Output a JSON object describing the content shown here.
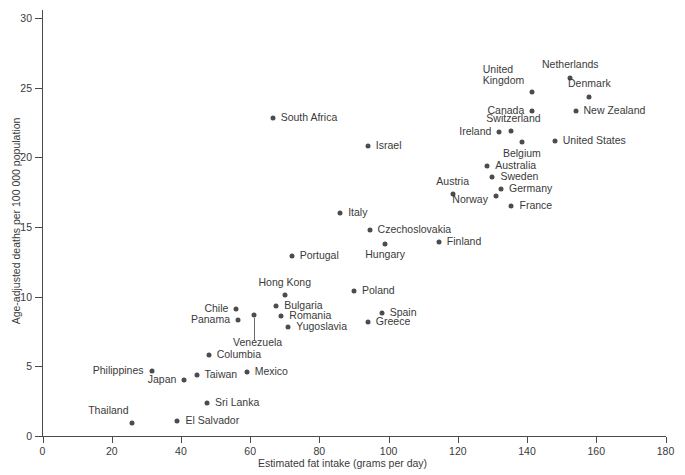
{
  "chart_data": {
    "type": "scatter",
    "title": "",
    "xlabel": "Estimated fat intake (grams per day)",
    "ylabel": "Age-adjusted deaths per 100 000 population",
    "xlim": [
      0,
      180
    ],
    "ylim": [
      0,
      30
    ],
    "xticks": [
      0,
      20,
      40,
      60,
      80,
      100,
      120,
      140,
      160,
      180
    ],
    "yticks": [
      0,
      5,
      10,
      15,
      20,
      25,
      30
    ],
    "grid": false,
    "legend": "none",
    "marker_color": "#4c4c4c",
    "axis_color": "#4a4a4a",
    "points": [
      {
        "label": "Netherlands",
        "x": 152.5,
        "y": 25.7,
        "lx": 0,
        "ly": -13,
        "anchor": "center"
      },
      {
        "label": "Denmark",
        "x": 158.0,
        "y": 24.3,
        "lx": 0,
        "ly": -13,
        "anchor": "center"
      },
      {
        "label": "New Zealand",
        "x": 154.0,
        "y": 23.3,
        "lx": 8,
        "ly": 0,
        "anchor": "left"
      },
      {
        "label": "United\nKingdom",
        "x": 141.5,
        "y": 24.7,
        "lx": -8,
        "ly": -17,
        "anchor": "right"
      },
      {
        "label": "Canada",
        "x": 141.5,
        "y": 23.3,
        "lx": -8,
        "ly": 0,
        "anchor": "right"
      },
      {
        "label": "Switzerland",
        "x": 135.5,
        "y": 21.9,
        "lx": 2,
        "ly": -12,
        "anchor": "center"
      },
      {
        "label": "Ireland",
        "x": 132.0,
        "y": 21.8,
        "lx": -8,
        "ly": 0,
        "anchor": "right"
      },
      {
        "label": "Belgium",
        "x": 138.5,
        "y": 21.1,
        "lx": 0,
        "ly": 12,
        "anchor": "center"
      },
      {
        "label": "United States",
        "x": 148.0,
        "y": 21.2,
        "lx": 8,
        "ly": 0,
        "anchor": "left"
      },
      {
        "label": "South Africa",
        "x": 66.5,
        "y": 22.8,
        "lx": 8,
        "ly": 0,
        "anchor": "left"
      },
      {
        "label": "Israel",
        "x": 94.0,
        "y": 20.8,
        "lx": 8,
        "ly": 0,
        "anchor": "left"
      },
      {
        "label": "Australia",
        "x": 128.5,
        "y": 19.4,
        "lx": 8,
        "ly": 0,
        "anchor": "left"
      },
      {
        "label": "Sweden",
        "x": 130.0,
        "y": 18.6,
        "lx": 8,
        "ly": 0,
        "anchor": "left"
      },
      {
        "label": "Germany",
        "x": 132.5,
        "y": 17.7,
        "lx": 8,
        "ly": 0,
        "anchor": "left"
      },
      {
        "label": "Austria",
        "x": 118.5,
        "y": 17.4,
        "lx": 0,
        "ly": -12,
        "anchor": "center"
      },
      {
        "label": "Norway",
        "x": 131.0,
        "y": 17.2,
        "lx": -8,
        "ly": 4,
        "anchor": "right"
      },
      {
        "label": "France",
        "x": 135.5,
        "y": 16.5,
        "lx": 8,
        "ly": 0,
        "anchor": "left"
      },
      {
        "label": "Italy",
        "x": 86.0,
        "y": 16.0,
        "lx": 8,
        "ly": 0,
        "anchor": "left"
      },
      {
        "label": "Czechoslovakia",
        "x": 94.5,
        "y": 14.8,
        "lx": 8,
        "ly": 0,
        "anchor": "left"
      },
      {
        "label": "Finland",
        "x": 114.5,
        "y": 13.9,
        "lx": 8,
        "ly": 0,
        "anchor": "left"
      },
      {
        "label": "Hungary",
        "x": 99.0,
        "y": 13.8,
        "lx": 0,
        "ly": 11,
        "anchor": "center"
      },
      {
        "label": "Portugal",
        "x": 72.0,
        "y": 12.9,
        "lx": 8,
        "ly": 0,
        "anchor": "left"
      },
      {
        "label": "Poland",
        "x": 90.0,
        "y": 10.4,
        "lx": 8,
        "ly": 0,
        "anchor": "left"
      },
      {
        "label": "Hong Kong",
        "x": 70.0,
        "y": 10.1,
        "lx": 0,
        "ly": -12,
        "anchor": "center"
      },
      {
        "label": "Bulgaria",
        "x": 67.5,
        "y": 9.3,
        "lx": 8,
        "ly": 0,
        "anchor": "left"
      },
      {
        "label": "Chile",
        "x": 56.0,
        "y": 9.1,
        "lx": -8,
        "ly": 0,
        "anchor": "right"
      },
      {
        "label": "Romania",
        "x": 69.0,
        "y": 8.6,
        "lx": 8,
        "ly": 0,
        "anchor": "left"
      },
      {
        "label": "Panama",
        "x": 56.5,
        "y": 8.3,
        "lx": -8,
        "ly": 0,
        "anchor": "right"
      },
      {
        "label": "Venezuela",
        "x": 61.0,
        "y": 8.7,
        "lx": 4,
        "ly": 28,
        "anchor": "center",
        "leader": 22
      },
      {
        "label": "Yugoslavia",
        "x": 71.0,
        "y": 7.8,
        "lx": 8,
        "ly": 0,
        "anchor": "left"
      },
      {
        "label": "Spain",
        "x": 98.0,
        "y": 8.8,
        "lx": 8,
        "ly": 0,
        "anchor": "left"
      },
      {
        "label": "Greece",
        "x": 94.0,
        "y": 8.2,
        "lx": 8,
        "ly": 0,
        "anchor": "left"
      },
      {
        "label": "Columbia",
        "x": 48.0,
        "y": 5.8,
        "lx": 8,
        "ly": 0,
        "anchor": "left"
      },
      {
        "label": "Philippines",
        "x": 31.5,
        "y": 4.7,
        "lx": -8,
        "ly": 0,
        "anchor": "right"
      },
      {
        "label": "Taiwan",
        "x": 44.5,
        "y": 4.4,
        "lx": 8,
        "ly": 0,
        "anchor": "left"
      },
      {
        "label": "Mexico",
        "x": 59.0,
        "y": 4.6,
        "lx": 8,
        "ly": 0,
        "anchor": "left"
      },
      {
        "label": "Japan",
        "x": 41.0,
        "y": 4.0,
        "lx": -8,
        "ly": 0,
        "anchor": "right"
      },
      {
        "label": "Sri Lanka",
        "x": 47.5,
        "y": 2.4,
        "lx": 8,
        "ly": 0,
        "anchor": "left"
      },
      {
        "label": "El Salvador",
        "x": 39.0,
        "y": 1.1,
        "lx": 8,
        "ly": 0,
        "anchor": "left"
      },
      {
        "label": "Thailand",
        "x": 26.0,
        "y": 0.9,
        "lx": -4,
        "ly": -12,
        "anchor": "right"
      }
    ]
  }
}
